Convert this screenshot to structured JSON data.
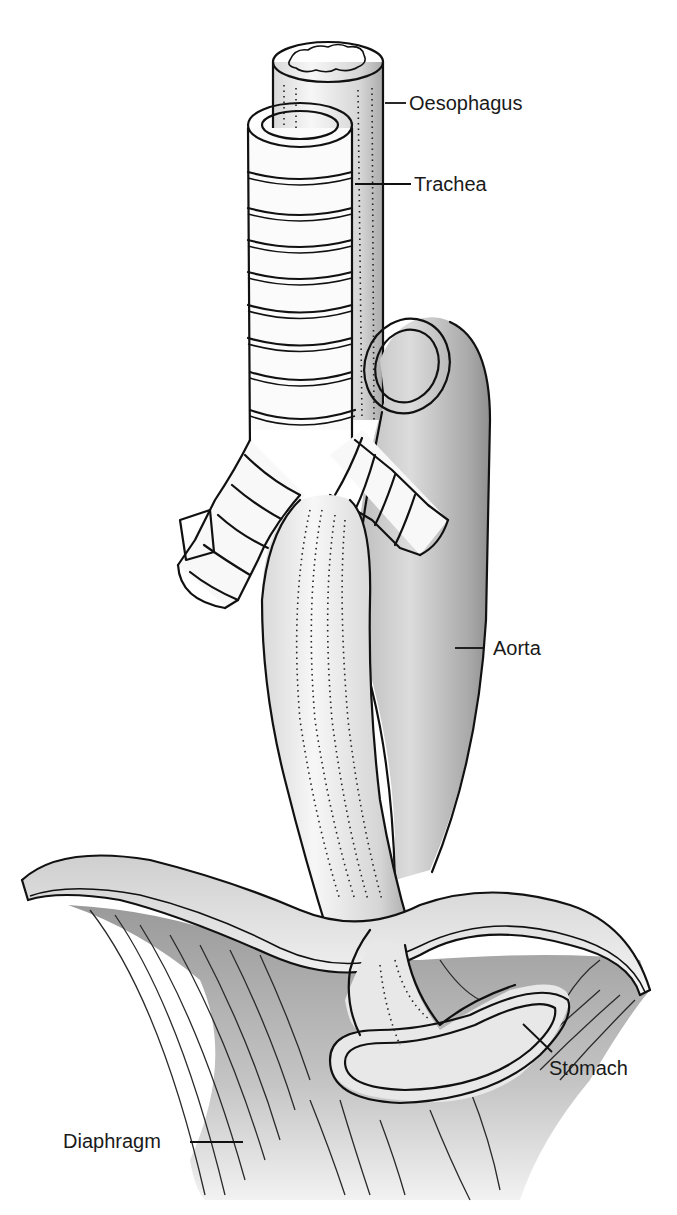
{
  "figure": {
    "type": "anatomical-illustration",
    "colors": {
      "background": "#ffffff",
      "outline": "#111111",
      "shade_light": "#e6e6e6",
      "shade_mid": "#bdbdbd",
      "shade_dark": "#8a8a8a",
      "lumen_dark": "#7d7d7d"
    }
  },
  "labels": [
    {
      "id": "oesophagus",
      "text": "Oesophagus",
      "x": 409,
      "y": 110,
      "line": [
        385,
        103,
        406,
        103
      ]
    },
    {
      "id": "trachea",
      "text": "Trachea",
      "x": 414,
      "y": 191,
      "line": [
        355,
        184,
        411,
        184
      ]
    },
    {
      "id": "aorta",
      "text": "Aorta",
      "x": 493,
      "y": 655,
      "line": [
        455,
        648,
        484,
        648
      ]
    },
    {
      "id": "stomach",
      "text": "Stomach",
      "x": 549,
      "y": 1075,
      "line": [
        523,
        1024,
        552,
        1052
      ]
    },
    {
      "id": "diaphragm",
      "text": "Diaphragm",
      "x": 63,
      "y": 1148,
      "line": [
        190,
        1142,
        243,
        1142
      ]
    }
  ]
}
